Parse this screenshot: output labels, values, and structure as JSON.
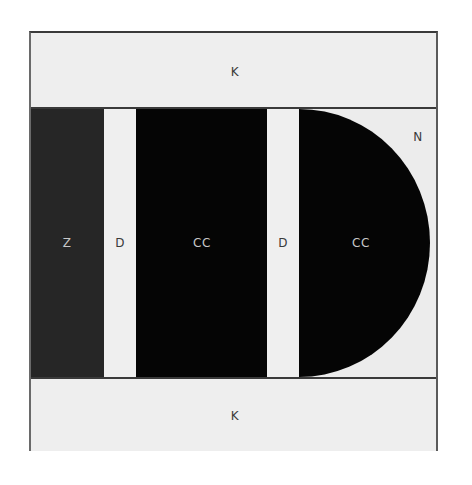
{
  "diagram": {
    "regions": {
      "top_band": {
        "label": "K"
      },
      "bottom_band": {
        "label": "K"
      },
      "left_block": {
        "label": "Z"
      },
      "strip_1": {
        "label": "D"
      },
      "center_block": {
        "label": "CC"
      },
      "strip_2": {
        "label": "D"
      },
      "half_disc": {
        "label": "CC"
      },
      "corner_region": {
        "label": "N"
      }
    },
    "colors": {
      "band_fill": "#eeeeee",
      "left_block_fill": "#262626",
      "cc_fill": "#050505",
      "strip_fill": "#efefef",
      "border": "#3a3a3a"
    }
  }
}
